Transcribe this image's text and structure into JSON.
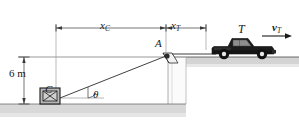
{
  "figure": {
    "background_color": "#ffffff",
    "line_color": "#1a1a1a",
    "ground_color": "#d6d6d6",
    "truck_body_color": "#1c1c1c",
    "truck_cab_color": "#8a8a8a",
    "crate_fill_color": "#b8b8b8"
  },
  "labels": {
    "distance_crate": {
      "text": "x",
      "subscript": "C"
    },
    "distance_truck": {
      "text": "x",
      "subscript": "T"
    },
    "truck": {
      "text": "T"
    },
    "velocity_truck": {
      "text": "v",
      "subscript": "T"
    },
    "point_a": {
      "text": "A"
    },
    "height": {
      "text": "6 m"
    },
    "crate": {
      "text": "C"
    },
    "angle": {
      "text": "θ"
    }
  },
  "icons": {
    "crate": "crate-box-icon",
    "truck": "pickup-truck-icon",
    "pulley": "pulley-bracket-icon",
    "velocity_arrow": "right-arrow-icon",
    "angle_arc": "angle-arc-icon"
  }
}
